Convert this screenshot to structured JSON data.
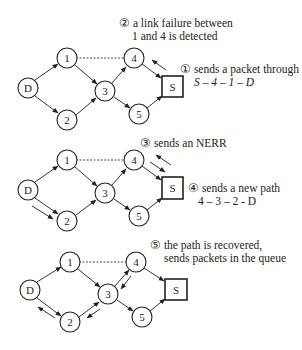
{
  "colors": {
    "stroke": "#222222",
    "background": "#ffffff"
  },
  "panels": [
    {
      "nodes": {
        "D": {
          "x": 28,
          "y": 88,
          "label": "D"
        },
        "1": {
          "x": 67,
          "y": 58,
          "label": "1"
        },
        "2": {
          "x": 67,
          "y": 120,
          "label": "2"
        },
        "3": {
          "x": 105,
          "y": 91,
          "label": "3"
        },
        "4": {
          "x": 134,
          "y": 58,
          "label": "4"
        },
        "5": {
          "x": 139,
          "y": 114,
          "label": "5"
        },
        "S": {
          "x": 172,
          "y": 86,
          "label": "S"
        }
      },
      "annotations": {
        "step2_line1": "② a link failure between",
        "step2_line2": "1 and 4 is detected",
        "step1_line1": "① sends a packet through",
        "step1_line2": "S – 4 – 1 – D"
      }
    },
    {
      "nodes": {
        "D": {
          "label": "D"
        },
        "1": {
          "label": "1"
        },
        "2": {
          "label": "2"
        },
        "3": {
          "label": "3"
        },
        "4": {
          "label": "4"
        },
        "5": {
          "label": "5"
        },
        "S": {
          "label": "S"
        }
      },
      "annotations": {
        "step3": "③ sends an NERR",
        "step4_line1": "④ sends a new path",
        "step4_line2": "4 – 3 – 2 - D"
      }
    },
    {
      "nodes": {
        "D": {
          "label": "D"
        },
        "1": {
          "label": "1"
        },
        "2": {
          "label": "2"
        },
        "3": {
          "label": "3"
        },
        "4": {
          "label": "4"
        },
        "5": {
          "label": "5"
        },
        "S": {
          "label": "S"
        }
      },
      "annotations": {
        "step5_line1": "⑤ the path is recovered,",
        "step5_line2": "sends  packets in the queue"
      }
    }
  ]
}
